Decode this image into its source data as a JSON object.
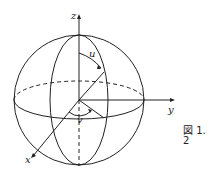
{
  "figure": {
    "caption": "図 1. 2",
    "labels": {
      "z": "z",
      "y": "y",
      "x": "x",
      "u": "u",
      "v": "v"
    },
    "stroke_color": "#222222"
  }
}
